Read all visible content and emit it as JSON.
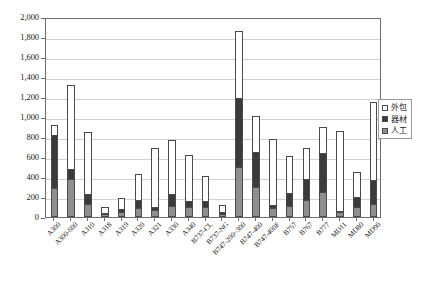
{
  "chart_data": {
    "type": "bar",
    "subtype": "stacked-vertical",
    "title": "",
    "xlabel": "",
    "ylabel": "",
    "ylim": [
      0,
      2000
    ],
    "y_ticks": [
      "0",
      "200",
      "400",
      "600",
      "800",
      "1,000",
      "1,200",
      "1,400",
      "1,600",
      "1,800",
      "2,000"
    ],
    "y_tick_values": [
      0,
      200,
      400,
      600,
      800,
      1000,
      1200,
      1400,
      1600,
      1800,
      2000
    ],
    "grid": true,
    "legend_position": "right",
    "categories": [
      "A300",
      "A300-600",
      "A310",
      "A318",
      "A319",
      "A320",
      "A321",
      "A330",
      "A340",
      "B737-CL",
      "B737-NG",
      "B747-200~300",
      "B747-400",
      "B747-400F",
      "B757",
      "B767",
      "B777",
      "MD11",
      "MD80",
      "MD90"
    ],
    "series": [
      {
        "name": "人工",
        "color": "#8e8e8e",
        "values": [
          290,
          380,
          130,
          30,
          50,
          90,
          70,
          110,
          100,
          100,
          35,
          500,
          300,
          90,
          110,
          170,
          250,
          50,
          105,
          130
        ]
      },
      {
        "name": "器材",
        "color": "#3b3b3b",
        "values": [
          540,
          110,
          110,
          20,
          40,
          90,
          40,
          130,
          70,
          70,
          20,
          700,
          360,
          40,
          140,
          220,
          400,
          20,
          105,
          250
        ]
      },
      {
        "name": "外包",
        "color": "#ffffff",
        "values": [
          100,
          840,
          620,
          60,
          110,
          260,
          590,
          540,
          460,
          250,
          75,
          670,
          360,
          660,
          370,
          310,
          260,
          800,
          250,
          780
        ]
      }
    ],
    "totals": [
      930,
      1330,
      860,
      110,
      200,
      440,
      700,
      780,
      630,
      420,
      130,
      1870,
      1020,
      790,
      620,
      700,
      910,
      870,
      460,
      1160
    ]
  },
  "legend": {
    "items": [
      {
        "label": "外包",
        "swatch": "outsource-swatch"
      },
      {
        "label": "器材",
        "swatch": "equipment-swatch"
      },
      {
        "label": "人工",
        "swatch": "labor-swatch"
      }
    ]
  }
}
